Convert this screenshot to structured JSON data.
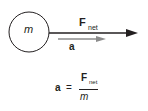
{
  "diagram": {
    "mass_label": "m",
    "force_label": "F",
    "force_subscript": "net",
    "accel_label": "a",
    "colors": {
      "outline": "#231f20",
      "force_arrow": "#231f20",
      "accel_arrow": "#8c8c8c",
      "background": "#ffffff"
    }
  },
  "equation": {
    "lhs": "a",
    "equals": "=",
    "numerator": "F",
    "numerator_subscript": "net",
    "denominator": "m"
  }
}
